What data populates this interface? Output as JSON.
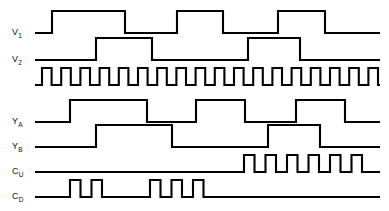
{
  "figure": {
    "background_color": "#ffffff",
    "trace_color": "#000000",
    "width": 389,
    "height": 211
  },
  "labels": {
    "v1": {
      "base": "V",
      "sub": "1"
    },
    "v2": {
      "base": "V",
      "sub": "2"
    },
    "clock": {
      "base": "",
      "sub": ""
    },
    "ya": {
      "base": "Y",
      "sub": "A"
    },
    "yb": {
      "base": "Y",
      "sub": "B"
    },
    "cu": {
      "base": "C",
      "sub": "U"
    },
    "cd": {
      "base": "C",
      "sub": "D"
    }
  },
  "chart_data": {
    "type": "line",
    "xlabel": "",
    "ylabel": "",
    "x_range": [
      35,
      380
    ],
    "grid": false,
    "legend": "none",
    "signal_levels": {
      "low": 0,
      "high": 1
    },
    "series": [
      {
        "name": "V1",
        "label": "V₁",
        "row_index": 0,
        "baseline_y": 33,
        "amplitude_px": 22,
        "start_level": 0,
        "transitions_x": [
          52,
          125,
          177,
          223,
          278,
          325
        ],
        "end_x": 380,
        "description": "Square wave, high 52-125, 177-223, 278-325"
      },
      {
        "name": "V2",
        "label": "V₂",
        "row_index": 1,
        "baseline_y": 60,
        "amplitude_px": 22,
        "start_level": 0,
        "transitions_x": [
          96,
          152,
          248,
          300
        ],
        "end_x": 380,
        "description": "Square wave, high 96-152, 248-300"
      },
      {
        "name": "CLK",
        "label": "",
        "row_index": 2,
        "baseline_y": 85,
        "amplitude_px": 17,
        "start_level": 0,
        "clock": true,
        "clock_start_x": 42,
        "clock_period_px": 19.2,
        "clock_high_px": 9.6,
        "clock_pulses": 18,
        "end_x": 380,
        "description": "Free-running clock, 18 pulses"
      },
      {
        "name": "YA",
        "label": "Yₐ",
        "row_index": 3,
        "baseline_y": 122,
        "amplitude_px": 22,
        "start_level": 0,
        "transitions_x": [
          70,
          147,
          196,
          245,
          296,
          345
        ],
        "end_x": 380,
        "description": "Square wave, high 70-147, 196-245, 296-345"
      },
      {
        "name": "YB",
        "label": "Yв",
        "row_index": 4,
        "baseline_y": 147,
        "amplitude_px": 22,
        "start_level": 0,
        "transitions_x": [
          96,
          172,
          268,
          320
        ],
        "end_x": 380,
        "description": "Square wave, high 96-172, 268-320"
      },
      {
        "name": "CU",
        "label": "Cᴜ",
        "row_index": 5,
        "baseline_y": 172,
        "amplitude_px": 17,
        "start_level": 0,
        "burst": true,
        "burst_start_x": 244,
        "burst_period_px": 21.5,
        "burst_high_px": 10.5,
        "burst_pulses": 6,
        "end_x": 380,
        "description": "Up-count pulse burst, 6 pulses starting at x=244"
      },
      {
        "name": "CD",
        "label": "Cᴅ",
        "row_index": 6,
        "baseline_y": 197,
        "amplitude_px": 17,
        "start_level": 0,
        "groups": [
          {
            "start_x": 70,
            "period_px": 21.5,
            "high_px": 10.5,
            "pulses": 2
          },
          {
            "start_x": 150,
            "period_px": 21.5,
            "high_px": 10.5,
            "pulses": 3
          }
        ],
        "end_x": 380,
        "description": "Down-count pulse groups: 2 pulses at x=70, 3 pulses at x=150"
      }
    ]
  }
}
